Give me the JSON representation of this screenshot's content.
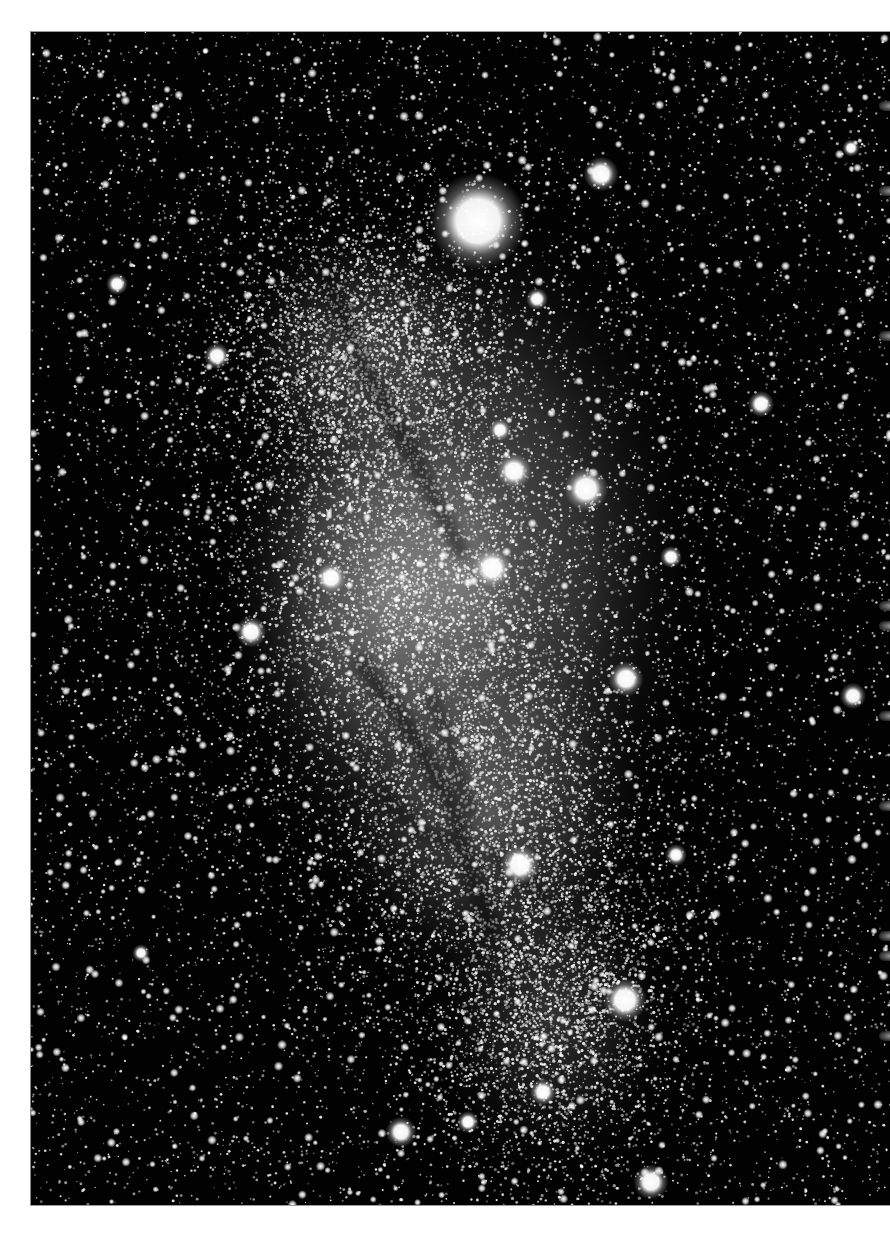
{
  "image": {
    "subject": "irregular galaxy star field",
    "description": "Black-and-white astronomical photograph of a dense irregular galaxy with dark dust lanes, surrounded by a rich foreground star field, printed on a white page",
    "frame": {
      "left": 30,
      "top": 31,
      "width": 860,
      "height": 1173
    },
    "colors": {
      "page_background": "#ffffff",
      "sky_background": "#020202",
      "star_color": "#ffffff",
      "galaxy_glow": "#bdbdbd",
      "dust_lane": "#1a1a1a"
    },
    "galaxy_glow_regions": [
      {
        "cx": 430,
        "cy": 540,
        "rx": 250,
        "ry": 390,
        "intensity": 0.55
      },
      {
        "cx": 360,
        "cy": 560,
        "rx": 170,
        "ry": 230,
        "intensity": 0.45
      },
      {
        "cx": 460,
        "cy": 780,
        "rx": 170,
        "ry": 200,
        "intensity": 0.35
      },
      {
        "cx": 520,
        "cy": 980,
        "rx": 130,
        "ry": 170,
        "intensity": 0.25
      },
      {
        "cx": 330,
        "cy": 320,
        "rx": 140,
        "ry": 140,
        "intensity": 0.3
      }
    ],
    "dust_lanes": [
      {
        "points": [
          [
            290,
            230
          ],
          [
            330,
            330
          ],
          [
            380,
            420
          ],
          [
            430,
            520
          ]
        ],
        "width": 14
      },
      {
        "points": [
          [
            330,
            630
          ],
          [
            380,
            700
          ],
          [
            420,
            770
          ],
          [
            440,
            840
          ],
          [
            460,
            900
          ]
        ],
        "width": 16
      },
      {
        "points": [
          [
            400,
            660
          ],
          [
            420,
            720
          ],
          [
            440,
            780
          ]
        ],
        "width": 10
      },
      {
        "points": [
          [
            350,
            760
          ],
          [
            390,
            800
          ],
          [
            420,
            810
          ]
        ],
        "width": 10
      },
      {
        "points": [
          [
            460,
            820
          ],
          [
            500,
            850
          ],
          [
            540,
            900
          ]
        ],
        "width": 8
      }
    ],
    "bright_stars": [
      {
        "x": 447,
        "y": 189,
        "r": 22,
        "label": "foreground-bright-star"
      },
      {
        "x": 570,
        "y": 142,
        "r": 8
      },
      {
        "x": 555,
        "y": 457,
        "r": 10
      },
      {
        "x": 483,
        "y": 439,
        "r": 8
      },
      {
        "x": 461,
        "y": 536,
        "r": 9
      },
      {
        "x": 220,
        "y": 600,
        "r": 7
      },
      {
        "x": 300,
        "y": 546,
        "r": 7
      },
      {
        "x": 595,
        "y": 647,
        "r": 8
      },
      {
        "x": 489,
        "y": 833,
        "r": 9
      },
      {
        "x": 594,
        "y": 968,
        "r": 10
      },
      {
        "x": 370,
        "y": 1100,
        "r": 7
      },
      {
        "x": 620,
        "y": 1150,
        "r": 8
      },
      {
        "x": 730,
        "y": 372,
        "r": 6
      },
      {
        "x": 822,
        "y": 664,
        "r": 6
      },
      {
        "x": 186,
        "y": 324,
        "r": 6
      },
      {
        "x": 86,
        "y": 252,
        "r": 5
      },
      {
        "x": 640,
        "y": 525,
        "r": 5
      },
      {
        "x": 506,
        "y": 267,
        "r": 5
      },
      {
        "x": 820,
        "y": 116,
        "r": 4
      },
      {
        "x": 469,
        "y": 398,
        "r": 5
      },
      {
        "x": 645,
        "y": 823,
        "r": 5
      },
      {
        "x": 110,
        "y": 921,
        "r": 4
      },
      {
        "x": 512,
        "y": 1060,
        "r": 6
      },
      {
        "x": 437,
        "y": 1090,
        "r": 5
      }
    ],
    "star_field": {
      "seed": 1729,
      "faint_count": 9000,
      "galaxy_count": 14000,
      "medium_count": 900
    },
    "right_edge_artifacts_y": [
      100,
      185,
      330,
      600,
      620,
      710,
      800,
      930,
      950,
      1030
    ]
  }
}
